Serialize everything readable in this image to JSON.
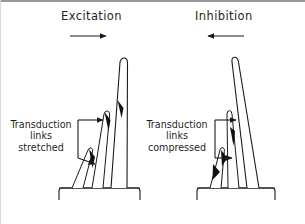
{
  "figure": {
    "kind": "scientific-diagram",
    "ink_color": "#1a1a1a",
    "fill_color": "#ffffff",
    "tip_link_color": "#111111",
    "background": "#ffffff",
    "border_color": "#9a9a9a"
  },
  "panels": [
    {
      "id": "excitation",
      "title": "Excitation",
      "direction_arrow": "arrow-right",
      "direction": "right",
      "caption_lines": [
        "Transduction",
        "links",
        "stretched"
      ],
      "caption_text": "Transduction links stretched",
      "bracket_arrows": [
        "arrow-right-top",
        "arrow-right-bottom"
      ],
      "tip_link_count": 3,
      "stereocilia_count": 3,
      "bundle_tilt_degrees": 14
    },
    {
      "id": "inhibition",
      "title": "Inhibition",
      "direction_arrow": "arrow-left",
      "direction": "left",
      "caption_lines": [
        "Transduction",
        "links",
        "compressed"
      ],
      "caption_text": "Transduction links compressed",
      "bracket_arrows": [
        "arrow-right-top",
        "arrow-right-bottom"
      ],
      "tip_link_count": 3,
      "stereocilia_count": 3,
      "bundle_tilt_degrees": 5
    }
  ],
  "icons": {
    "arrow_right": "arrow-right-icon",
    "arrow_left": "arrow-left-icon",
    "bracket": "bracket-icon",
    "stereocilium": "stereocilium-icon",
    "tip_link": "tip-link-icon",
    "cell_body": "cell-body-icon"
  }
}
